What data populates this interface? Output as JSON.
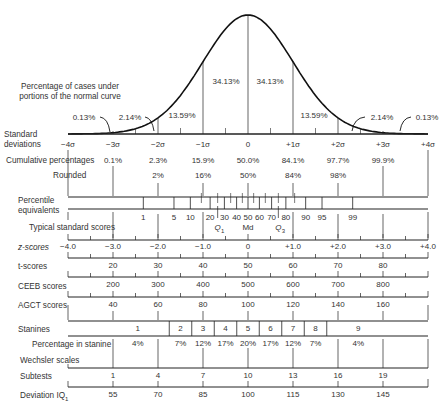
{
  "title_note": "Percentage of cases under portions of the normal curve",
  "curve": {
    "segment_percentages": [
      "0.13%",
      "2.14%",
      "13.59%",
      "34.13%",
      "34.13%",
      "13.59%",
      "2.14%",
      "0.13%"
    ]
  },
  "rows": {
    "standard_deviations": {
      "label_line1": "Standard",
      "label_line2": "deviations",
      "ticks": [
        "−4σ",
        "−3σ",
        "−2σ",
        "−1σ",
        "0",
        "+1σ",
        "+2σ",
        "+3σ",
        "+4σ"
      ]
    },
    "cumulative": {
      "label": "Cumulative percentages",
      "values": [
        "0.1%",
        "2.3%",
        "15.9%",
        "50.0%",
        "84.1%",
        "97.7%",
        "99.9%"
      ]
    },
    "rounded": {
      "label": "Rounded",
      "values": [
        "2%",
        "16%",
        "50%",
        "84%",
        "98%"
      ]
    },
    "percentile": {
      "label_line1": "Percentile",
      "label_line2": "equivalents",
      "values": [
        "1",
        "5",
        "10",
        "20",
        "30",
        "40",
        "50",
        "60",
        "70",
        "80",
        "90",
        "95",
        "99"
      ]
    },
    "typical": {
      "label": "Typical standard scores",
      "quartiles": [
        "Q1",
        "Md",
        "Q3"
      ]
    },
    "z_scores": {
      "label": "z-scores",
      "values": [
        "−4.0",
        "−3.0",
        "−2.0",
        "−1.0",
        "0",
        "+1.0",
        "+2.0",
        "+3.0",
        "+4.0"
      ]
    },
    "t_scores": {
      "label": "t-scores",
      "values": [
        "20",
        "30",
        "40",
        "50",
        "60",
        "70",
        "80"
      ]
    },
    "ceeb": {
      "label": "CEEB scores",
      "values": [
        "200",
        "300",
        "400",
        "500",
        "600",
        "700",
        "800"
      ]
    },
    "agct": {
      "label": "AGCT scores",
      "values": [
        "40",
        "60",
        "80",
        "100",
        "120",
        "140",
        "160"
      ]
    },
    "stanines": {
      "label": "Stanines",
      "values": [
        "1",
        "2",
        "3",
        "4",
        "5",
        "6",
        "7",
        "8",
        "9"
      ]
    },
    "stanine_pct": {
      "label": "Percentage in stanine",
      "values": [
        "4%",
        "7%",
        "12%",
        "17%",
        "20%",
        "17%",
        "12%",
        "7%",
        "4%"
      ]
    },
    "wechsler": {
      "label": "Wechsler scales"
    },
    "subtests": {
      "label": "Subtests",
      "values": [
        "1",
        "4",
        "7",
        "10",
        "13",
        "16",
        "19"
      ]
    },
    "deviation_iq": {
      "label": "Deviation IQ",
      "label_sub": "1",
      "values": [
        "55",
        "70",
        "85",
        "100",
        "115",
        "130",
        "145"
      ]
    }
  }
}
